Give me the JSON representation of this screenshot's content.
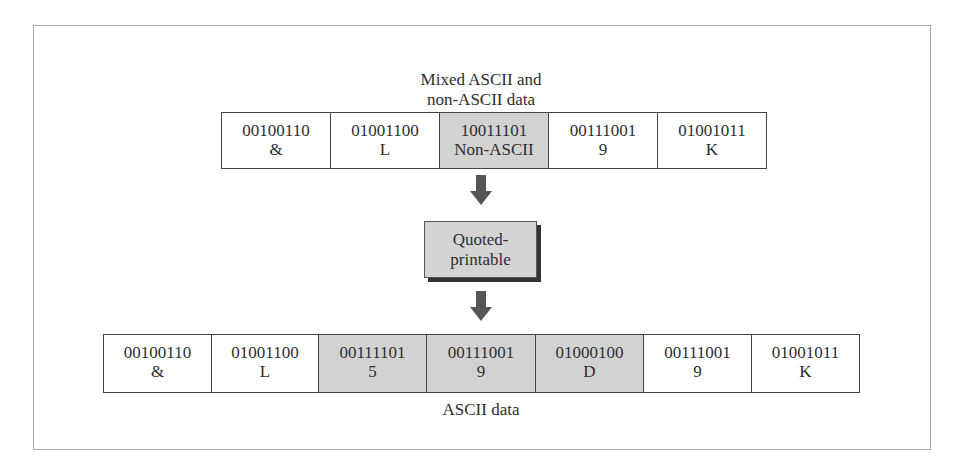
{
  "diagram": {
    "top_caption_line1": "Mixed ASCII and",
    "top_caption_line2": "non-ASCII data",
    "top_row": [
      {
        "bits": "00100110",
        "char": "&",
        "shaded": false
      },
      {
        "bits": "01001100",
        "char": "L",
        "shaded": false
      },
      {
        "bits": "10011101",
        "char": "Non-ASCII",
        "shaded": true
      },
      {
        "bits": "00111001",
        "char": "9",
        "shaded": false
      },
      {
        "bits": "01001011",
        "char": "K",
        "shaded": false
      }
    ],
    "process_line1": "Quoted-",
    "process_line2": "printable",
    "bottom_row": [
      {
        "bits": "00100110",
        "char": "&",
        "shaded": false
      },
      {
        "bits": "01001100",
        "char": "L",
        "shaded": false
      },
      {
        "bits": "00111101",
        "char": "5",
        "shaded": true
      },
      {
        "bits": "00111001",
        "char": "9",
        "shaded": true
      },
      {
        "bits": "01000100",
        "char": "D",
        "shaded": true
      },
      {
        "bits": "00111001",
        "char": "9",
        "shaded": false
      },
      {
        "bits": "01001011",
        "char": "K",
        "shaded": false
      }
    ],
    "bottom_caption": "ASCII data",
    "colors": {
      "shaded": "#d2d2d2",
      "border": "#444444",
      "arrow": "#555555"
    }
  }
}
